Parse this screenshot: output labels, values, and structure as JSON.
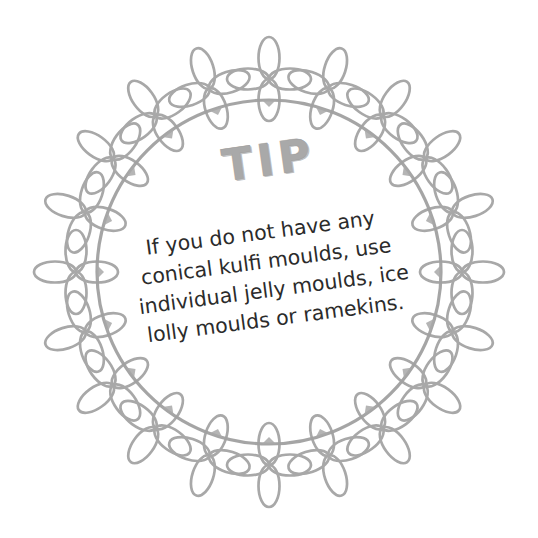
{
  "card": {
    "background_color": "#ffffff",
    "heading": "TIP",
    "heading_color": "#a9a9a9",
    "body_color": "#2b2b2b",
    "body_lines": [
      "If you do not have any",
      "conical kulfi moulds, use",
      "individual jelly moulds, ice",
      "lolly moulds or ramekins."
    ],
    "body_text": "If you do not have any conical kulfi moulds, use individual jelly moulds, ice lolly moulds or ramekins."
  },
  "wreath": {
    "stroke_color": "#a8a8a8",
    "inner_circle_color": "#a0a0a0",
    "flower_count": 20,
    "petal_count_per_flower": 4,
    "center_x": 269,
    "center_y": 272,
    "inner_radius": 172,
    "outer_radius": 230
  }
}
